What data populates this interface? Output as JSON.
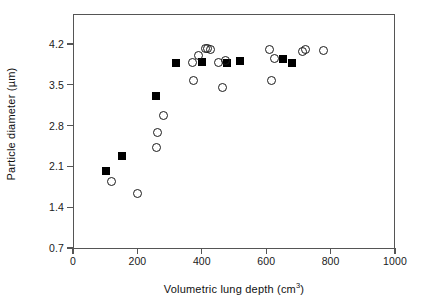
{
  "figure": {
    "background": "#ffffff",
    "axis_color": "#555555",
    "marker_color": "#000000"
  },
  "axes": {
    "y_title": "Particle diameter (µm)",
    "x_title_main": "Volumetric lung depth (cm",
    "x_title_sup": "3",
    "x_title_close": ")",
    "y_ticks": [
      "0.7",
      "1.4",
      "2.1",
      "2.8",
      "3.5",
      "4.2"
    ],
    "y_tick_values": [
      0.7,
      1.4,
      2.1,
      2.8,
      3.5,
      4.2
    ],
    "x_ticks": [
      "0",
      "200",
      "400",
      "600",
      "800",
      "1000"
    ],
    "x_tick_values": [
      0,
      200,
      400,
      600,
      800,
      1000
    ]
  },
  "chart_data": {
    "type": "scatter",
    "title": "",
    "xlabel": "Volumetric lung depth (cm3)",
    "ylabel": "Particle diameter (µm)",
    "xlim": [
      0,
      1000
    ],
    "ylim": [
      0.7,
      4.6
    ],
    "grid": false,
    "legend": "none",
    "series": [
      {
        "name": "filled-square",
        "marker": "square",
        "filled": true,
        "color": "#000000",
        "points": [
          [
            103,
            2.02
          ],
          [
            152,
            2.27
          ],
          [
            258,
            3.31
          ],
          [
            320,
            3.87
          ],
          [
            400,
            3.89
          ],
          [
            478,
            3.88
          ],
          [
            520,
            3.9
          ],
          [
            651,
            3.95
          ],
          [
            681,
            3.88
          ]
        ]
      },
      {
        "name": "open-circle",
        "marker": "circle",
        "filled": false,
        "color": "#1a1a1a",
        "points": [
          [
            120,
            1.84
          ],
          [
            200,
            1.63
          ],
          [
            258,
            2.43
          ],
          [
            262,
            2.69
          ],
          [
            281,
            2.98
          ],
          [
            372,
            3.89
          ],
          [
            374,
            3.58
          ],
          [
            390,
            4.01
          ],
          [
            412,
            4.12
          ],
          [
            418,
            4.12
          ],
          [
            428,
            4.11
          ],
          [
            452,
            3.88
          ],
          [
            463,
            3.46
          ],
          [
            474,
            3.91
          ],
          [
            610,
            4.11
          ],
          [
            616,
            3.58
          ],
          [
            625,
            3.95
          ],
          [
            714,
            4.07
          ],
          [
            722,
            4.1
          ],
          [
            778,
            4.08
          ]
        ]
      }
    ]
  }
}
